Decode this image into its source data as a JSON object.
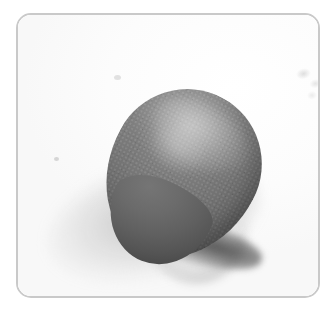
{
  "image": {
    "subject": "gray teardrop-shaped stone",
    "alt_text": "A smooth gray teardrop-shaped stone resting on a white surface, casting a soft shadow to the lower left",
    "background_color": "#ffffff",
    "frame": {
      "border_color": "#c9c9c9",
      "border_width_px": 2,
      "corner_radius_px": 15,
      "left_px": 16,
      "top_px": 13,
      "width_px": 304,
      "height_px": 285
    },
    "object": {
      "name": "stone",
      "shape": "teardrop",
      "base_color": "#6e6e6e",
      "highlight_color": "#8e8e8e",
      "shadow_color": "#4b4b4b",
      "bounds": {
        "left_px": 88,
        "top_px": 76,
        "right_px": 252,
        "bottom_px": 248
      },
      "orientation_degrees": 28
    },
    "shadow": {
      "name": "cast-shadow",
      "direction": "lower-left",
      "color": "#787878",
      "contact_color": "#303030"
    },
    "artifacts": [
      {
        "name": "smudge",
        "location": "upper-right",
        "color": "#969696"
      },
      {
        "name": "speck",
        "location": "left-middle",
        "color": "#aaaaaa"
      },
      {
        "name": "speck",
        "location": "upper-left",
        "color": "#b9b9b9"
      }
    ]
  }
}
